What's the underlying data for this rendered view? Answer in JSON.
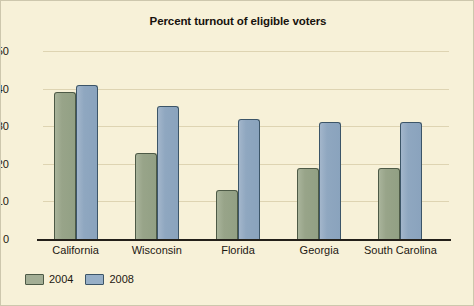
{
  "chart_data": {
    "type": "bar",
    "title": "Percent turnout of eligible voters",
    "xlabel": "",
    "ylabel": "",
    "ylim": [
      0,
      50
    ],
    "yticks": [
      0,
      10,
      20,
      30,
      40,
      50
    ],
    "grid": true,
    "legend_position": "bottom-left",
    "categories": [
      "California",
      "Wisconsin",
      "Florida",
      "Georgia",
      "South Carolina"
    ],
    "series": [
      {
        "name": "2004",
        "color": "#98a489",
        "values": [
          39,
          23,
          13,
          19,
          19
        ]
      },
      {
        "name": "2008",
        "color": "#8fa7c0",
        "values": [
          41,
          35.5,
          32,
          31,
          31
        ]
      }
    ]
  },
  "figure": {
    "background": "#f7f1d8",
    "border_color": "#cdc7ad",
    "axis_color": "#24201a",
    "gridline_color": "#ded4b2",
    "text_color": "#1d1812"
  }
}
